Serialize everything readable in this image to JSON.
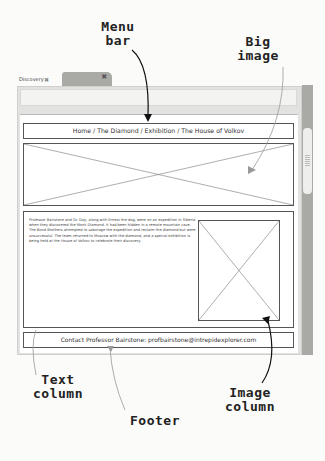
{
  "annotations": {
    "menu_bar": "Menu\nbar",
    "big_image": "Big\nimage",
    "text_column": "Text\ncolumn",
    "footer": "Footer",
    "image_column": "Image\ncolumn"
  },
  "browser": {
    "tabs": [
      {
        "label": "Discovery",
        "close": "✖"
      },
      {
        "label": "",
        "close": "✖"
      }
    ]
  },
  "page": {
    "breadcrumb": "Home / The Diamond / Exhibition / The House of Volkov",
    "body_text": "Professor Bairstone and Dr. Day, along with Ernest the dog, were on an expedition in Siberia when they discovered the Monk Diamond. It had been hidden in a remote mountain cave. The Bond Brothers attempted to sabotage the expedition and reclaim the diamond but were unsuccessful. The team returned to Moscow with the diamond, and a special exhibition is being held at the House of Volkov to celebrate their discovery.",
    "footer": "Contact Professor Bairstone: profbairstone@intrepidexplorer.com"
  },
  "colors": {
    "frame": "#e2e2e0",
    "scrollbar": "#a9a9a6",
    "wire": "#555555"
  }
}
